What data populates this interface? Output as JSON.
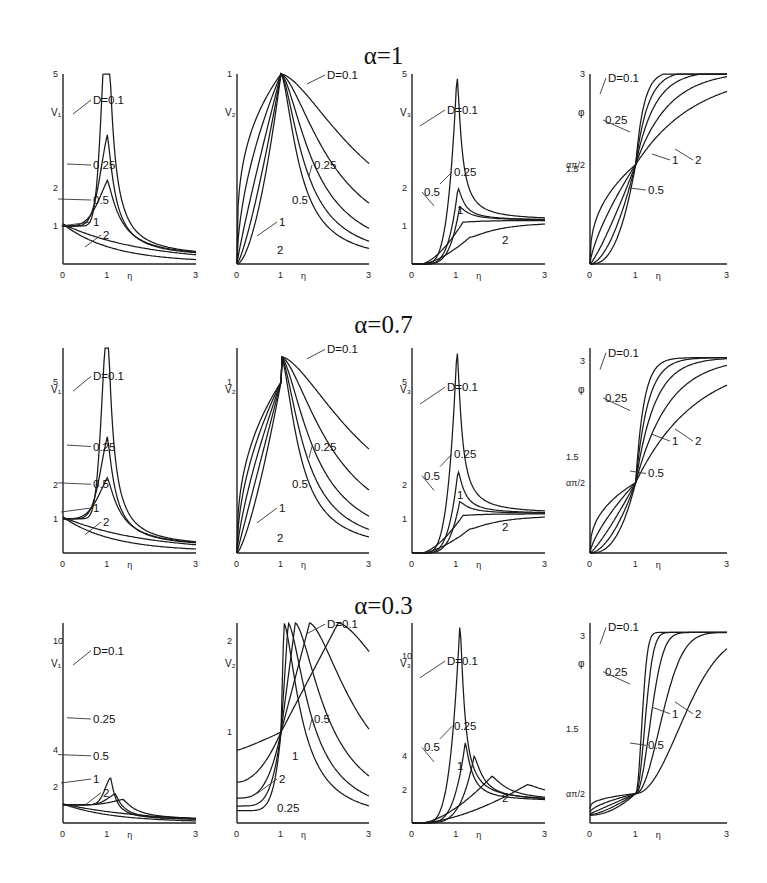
{
  "rows": [
    {
      "title": "α=1",
      "alpha": 1.0
    },
    {
      "title": "α=0.7",
      "alpha": 0.7
    },
    {
      "title": "α=0.3",
      "alpha": 0.3
    }
  ],
  "chart_data": [
    {
      "type": "line",
      "row_title": "α=1",
      "ylabel": "V₁",
      "xlabel": "η",
      "x_ticks": [
        "0",
        "1",
        "3"
      ],
      "y_ticks": [
        "1",
        "2",
        "5"
      ],
      "xlim": [
        0,
        3
      ],
      "ylim": [
        0,
        5
      ],
      "series": [
        {
          "name": "D=0.1",
          "peak": {
            "x": 1,
            "y": 5
          }
        },
        {
          "name": "0.25",
          "peak": {
            "x": 1,
            "y": 2.0
          }
        },
        {
          "name": "0.5",
          "peak": {
            "x": 0.8,
            "y": 1.1
          }
        },
        {
          "name": "1"
        },
        {
          "name": "2"
        }
      ],
      "annotations": [
        "D=0.1",
        "0.25",
        "0.5",
        "1",
        "2"
      ]
    },
    {
      "type": "line",
      "row_title": "α=1",
      "ylabel": "V₂",
      "xlabel": "η",
      "x_ticks": [
        "0",
        "1",
        "3"
      ],
      "y_ticks": [
        "1"
      ],
      "xlim": [
        0,
        3
      ],
      "ylim": [
        0,
        1
      ],
      "series": [
        {
          "name": "D=0.1"
        },
        {
          "name": "0.25"
        },
        {
          "name": "0.5"
        },
        {
          "name": "1"
        },
        {
          "name": "2"
        }
      ],
      "common_point": {
        "x": 1,
        "y": 1
      },
      "annotations": [
        "2",
        "1",
        "0.5",
        "0.25",
        "D=0.1"
      ]
    },
    {
      "type": "line",
      "row_title": "α=1",
      "ylabel": "V₃",
      "xlabel": "η",
      "x_ticks": [
        "0",
        "1",
        "3"
      ],
      "y_ticks": [
        "1",
        "2",
        "5"
      ],
      "xlim": [
        0,
        3
      ],
      "ylim": [
        0,
        5
      ],
      "series": [
        {
          "name": "D=0.1",
          "peak": {
            "x": 1,
            "y": 5
          }
        },
        {
          "name": "0.25",
          "peak": {
            "x": 1.05,
            "y": 2.0
          }
        },
        {
          "name": "0.5"
        },
        {
          "name": "1"
        },
        {
          "name": "2"
        }
      ],
      "annotations": [
        "D=0.1",
        "0.25",
        "0.5",
        "1",
        "2"
      ]
    },
    {
      "type": "line",
      "row_title": "α=1",
      "ylabel": "φ",
      "xlabel": "η",
      "x_ticks": [
        "0",
        "1",
        "3"
      ],
      "y_ticks": [
        "1.5",
        "απ/2",
        "3"
      ],
      "xlim": [
        0,
        3
      ],
      "ylim": [
        0,
        3
      ],
      "series": [
        {
          "name": "D=0.1"
        },
        {
          "name": "0.25"
        },
        {
          "name": "0.5"
        },
        {
          "name": "1"
        },
        {
          "name": "2"
        }
      ],
      "common_point": {
        "x": 1,
        "y": 1.57
      },
      "annotations": [
        "D=0.1",
        "0.25",
        "0.5",
        "1",
        "2"
      ]
    },
    {
      "type": "line",
      "row_title": "α=0.7",
      "ylabel": "V₁",
      "xlabel": "η",
      "x_ticks": [
        "0",
        "1",
        "3"
      ],
      "y_ticks": [
        "1",
        "2",
        "5"
      ],
      "xlim": [
        0,
        3
      ],
      "ylim": [
        0,
        6
      ],
      "series": [
        {
          "name": "D=0.1",
          "peak": {
            "x": 1,
            "y": 5.6
          }
        },
        {
          "name": "0.25",
          "peak": {
            "x": 1,
            "y": 2.1
          }
        },
        {
          "name": "0.5",
          "peak": {
            "x": 1,
            "y": 1.1
          }
        },
        {
          "name": "1"
        },
        {
          "name": "2"
        }
      ],
      "annotations": [
        "D=0.1",
        "0.25",
        "0.5",
        "1",
        "2"
      ]
    },
    {
      "type": "line",
      "row_title": "α=0.7",
      "ylabel": "V₂",
      "xlabel": "η",
      "x_ticks": [
        "0",
        "1",
        "3"
      ],
      "y_ticks": [
        "1"
      ],
      "xlim": [
        0,
        3
      ],
      "ylim": [
        0,
        1.2
      ],
      "series": [
        {
          "name": "D=0.1"
        },
        {
          "name": "0.25"
        },
        {
          "name": "0.5"
        },
        {
          "name": "1"
        },
        {
          "name": "2"
        }
      ],
      "common_point": {
        "x": 1,
        "y": 1
      },
      "annotations": [
        "2",
        "1",
        "0.5",
        "0.25",
        "D=0.1"
      ]
    },
    {
      "type": "line",
      "row_title": "α=0.7",
      "ylabel": "V₃",
      "xlabel": "η",
      "x_ticks": [
        "0",
        "1",
        "3"
      ],
      "y_ticks": [
        "1",
        "2",
        "5"
      ],
      "xlim": [
        0,
        3
      ],
      "ylim": [
        0,
        6
      ],
      "series": [
        {
          "name": "D=0.1",
          "peak": {
            "x": 1,
            "y": 6
          }
        },
        {
          "name": "0.25",
          "peak": {
            "x": 1.1,
            "y": 2.6
          }
        },
        {
          "name": "0.5"
        },
        {
          "name": "1"
        },
        {
          "name": "2"
        }
      ],
      "annotations": [
        "D=0.1",
        "0.25",
        "0.5",
        "1",
        "2"
      ]
    },
    {
      "type": "line",
      "row_title": "α=0.7",
      "ylabel": "φ",
      "xlabel": "η",
      "x_ticks": [
        "0",
        "1",
        "3"
      ],
      "y_ticks": [
        "απ/2",
        "1.5",
        "3"
      ],
      "xlim": [
        0,
        3
      ],
      "ylim": [
        0,
        3.2
      ],
      "series": [
        {
          "name": "D=0.1"
        },
        {
          "name": "0.25"
        },
        {
          "name": "0.5"
        },
        {
          "name": "1"
        },
        {
          "name": "2"
        }
      ],
      "common_point": {
        "x": 1,
        "y": 1.1
      },
      "annotations": [
        "D=0.1",
        "0.25",
        "0.5",
        "1",
        "2"
      ]
    },
    {
      "type": "line",
      "row_title": "α=0.3",
      "ylabel": "V₁",
      "xlabel": "η",
      "x_ticks": [
        "0",
        "1",
        "3"
      ],
      "y_ticks": [
        "2",
        "4",
        "10"
      ],
      "xlim": [
        0,
        3
      ],
      "ylim": [
        0,
        11
      ],
      "series": [
        {
          "name": "D=0.1",
          "peak": {
            "x": 1.05,
            "y": 11
          }
        },
        {
          "name": "0.25",
          "peak": {
            "x": 1.15,
            "y": 4
          }
        },
        {
          "name": "0.5",
          "peak": {
            "x": 1.35,
            "y": 2.1
          }
        },
        {
          "name": "1"
        },
        {
          "name": "2"
        }
      ],
      "annotations": [
        "D=0.1",
        "0.25",
        "0.5",
        "1",
        "2"
      ]
    },
    {
      "type": "line",
      "row_title": "α=0.3",
      "ylabel": "V₂",
      "xlabel": "η",
      "x_ticks": [
        "0",
        "1",
        "3"
      ],
      "y_ticks": [
        "1",
        "2"
      ],
      "xlim": [
        0,
        3
      ],
      "ylim": [
        0,
        2.2
      ],
      "series": [
        {
          "name": "D=0.1",
          "peak": {
            "x": 1.05,
            "y": 2.2
          }
        },
        {
          "name": "0.25",
          "peak": {
            "x": 1.2,
            "y": 2.2
          }
        },
        {
          "name": "0.5",
          "peak": {
            "x": 1.4,
            "y": 2.2
          }
        },
        {
          "name": "1",
          "peak": {
            "x": 1.75,
            "y": 2.2
          }
        },
        {
          "name": "2",
          "peak": {
            "x": 2.35,
            "y": 2.2
          }
        }
      ],
      "common_point": {
        "x": 1,
        "y": 1
      },
      "annotations": [
        "0.25",
        "2",
        "1",
        "0.5",
        "D=0.1"
      ]
    },
    {
      "type": "line",
      "row_title": "α=0.3",
      "ylabel": "V₃",
      "xlabel": "η",
      "x_ticks": [
        "0",
        "1",
        "3"
      ],
      "y_ticks": [
        "2",
        "4",
        "10"
      ],
      "xlim": [
        0,
        3
      ],
      "ylim": [
        0,
        12
      ],
      "series": [
        {
          "name": "D=0.1",
          "peak": {
            "x": 1.05,
            "y": 12
          }
        },
        {
          "name": "0.25",
          "peak": {
            "x": 1.2,
            "y": 6.1
          }
        },
        {
          "name": "0.5",
          "peak": {
            "x": 1.4,
            "y": 4.1
          }
        },
        {
          "name": "1",
          "peak": {
            "x": 1.85,
            "y": 2.8
          }
        },
        {
          "name": "2",
          "peak": {
            "x": 2.6,
            "y": 2.3
          }
        }
      ],
      "annotations": [
        "D=0.1",
        "0.25",
        "0.5",
        "1",
        "2"
      ]
    },
    {
      "type": "line",
      "row_title": "α=0.3",
      "ylabel": "φ",
      "xlabel": "η",
      "x_ticks": [
        "0",
        "1",
        "3"
      ],
      "y_ticks": [
        "απ/2",
        "1.5",
        "3"
      ],
      "xlim": [
        0,
        3
      ],
      "ylim": [
        0,
        3.2
      ],
      "series": [
        {
          "name": "D=0.1"
        },
        {
          "name": "0.25"
        },
        {
          "name": "0.5"
        },
        {
          "name": "1"
        },
        {
          "name": "2"
        }
      ],
      "common_point": {
        "x": 1,
        "y": 0.47
      },
      "annotations": [
        "D=0.1",
        "0.25",
        "0.5",
        "1",
        "2"
      ]
    }
  ]
}
